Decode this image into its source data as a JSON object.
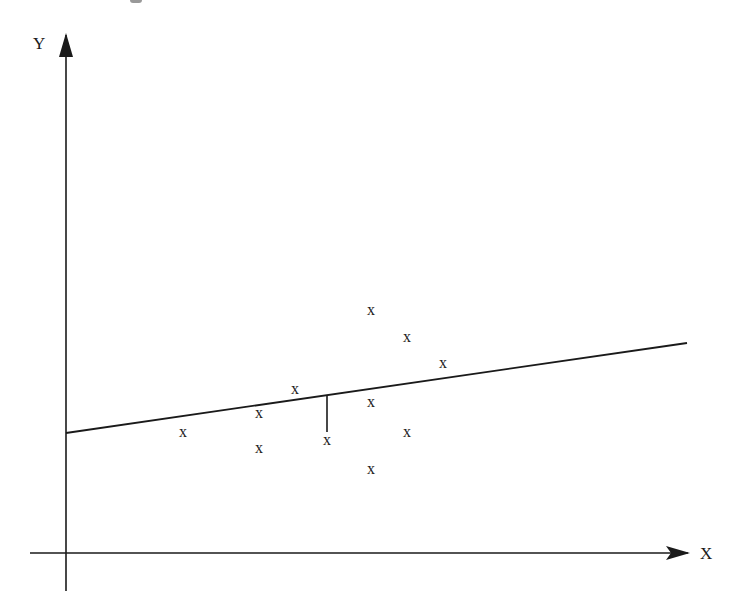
{
  "diagram": {
    "type": "scatter-with-regression-line",
    "axes": {
      "x_label": "X",
      "y_label": "Y",
      "origin_px": [
        66,
        553
      ],
      "x_axis": {
        "from_px": [
          30,
          553
        ],
        "to_px": [
          688,
          553
        ],
        "arrow": true
      },
      "y_axis": {
        "from_px": [
          66,
          591
        ],
        "to_px": [
          66,
          35
        ],
        "arrow": true
      }
    },
    "regression_line": {
      "from_px": [
        66,
        433
      ],
      "to_px": [
        687,
        343
      ],
      "color": "#1a1a1a"
    },
    "residual_segment": {
      "x_px": 327,
      "from_y_px": 395,
      "to_y_px": 432
    },
    "point_marker": "x",
    "points_px": [
      {
        "x": 183,
        "y": 433
      },
      {
        "x": 259,
        "y": 414
      },
      {
        "x": 259,
        "y": 449
      },
      {
        "x": 295,
        "y": 390
      },
      {
        "x": 327,
        "y": 441
      },
      {
        "x": 371,
        "y": 311
      },
      {
        "x": 407,
        "y": 338
      },
      {
        "x": 443,
        "y": 364
      },
      {
        "x": 371,
        "y": 403
      },
      {
        "x": 407,
        "y": 433
      },
      {
        "x": 371,
        "y": 470
      }
    ],
    "colors": {
      "ink": "#1a1a1a",
      "background": "#ffffff"
    }
  }
}
